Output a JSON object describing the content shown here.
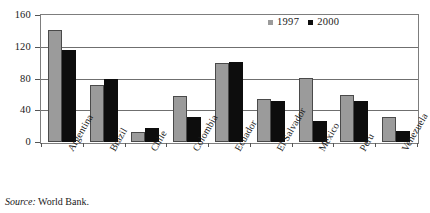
{
  "chart_data": {
    "type": "bar",
    "title": "",
    "subtitle": "",
    "xlabel": "",
    "ylabel": "",
    "ylim": [
      0,
      160
    ],
    "yticks": [
      0,
      40,
      80,
      120,
      160
    ],
    "ytick_labels": [
      "0",
      "40",
      "80",
      "120",
      "160"
    ],
    "grid": true,
    "legend_position": "top-right",
    "categories": [
      "Argentina",
      "Brazil",
      "Chile",
      "Colombia",
      "Ecuador",
      "El Salvador",
      "Mexico",
      "Peru",
      "Venezuela"
    ],
    "series": [
      {
        "name": "1997",
        "color": "#9b9b9b",
        "values": [
          141,
          72,
          12,
          58,
          99,
          54,
          81,
          59,
          32
        ]
      },
      {
        "name": "2000",
        "color": "#0d0d0d",
        "values": [
          116,
          80,
          18,
          32,
          101,
          52,
          27,
          52,
          14
        ]
      }
    ]
  },
  "legend": {
    "entries": [
      {
        "label": "1997",
        "swatch": "gray-square-icon"
      },
      {
        "label": "2000",
        "swatch": "black-square-icon"
      }
    ]
  },
  "source": {
    "label": "Source:",
    "value": " World Bank."
  }
}
